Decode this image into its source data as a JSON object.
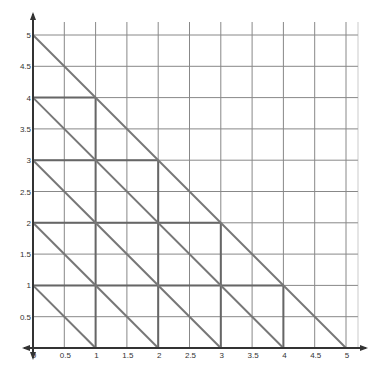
{
  "chart_data": {
    "type": "line",
    "title": "",
    "xlabel": "",
    "ylabel": "",
    "xlim": [
      0,
      5
    ],
    "ylim": [
      0,
      5
    ],
    "grid": true,
    "grid_step": 0.5,
    "x_ticks": [
      "0",
      "0.5",
      "1",
      "1.5",
      "2",
      "2.5",
      "3",
      "3.5",
      "4",
      "4.5",
      "5"
    ],
    "y_ticks": [
      "0.5",
      "1",
      "1.5",
      "2",
      "2.5",
      "3",
      "3.5",
      "4",
      "4.5",
      "5"
    ],
    "series": [
      {
        "name": "x+y=1",
        "points": [
          [
            0,
            1
          ],
          [
            1,
            0
          ]
        ]
      },
      {
        "name": "x+y=2",
        "points": [
          [
            0,
            2
          ],
          [
            2,
            0
          ]
        ]
      },
      {
        "name": "x+y=3",
        "points": [
          [
            0,
            3
          ],
          [
            3,
            0
          ]
        ]
      },
      {
        "name": "x+y=4",
        "points": [
          [
            0,
            4
          ],
          [
            4,
            0
          ]
        ]
      },
      {
        "name": "x+y=5",
        "points": [
          [
            0,
            5
          ],
          [
            5,
            0
          ]
        ]
      }
    ],
    "staircase": {
      "horizontal": [
        [
          0,
          1,
          4
        ],
        [
          0,
          2,
          3
        ],
        [
          0,
          3,
          2
        ],
        [
          0,
          4,
          1
        ]
      ],
      "vertical": [
        [
          1,
          0,
          4
        ],
        [
          2,
          0,
          3
        ],
        [
          3,
          0,
          2
        ],
        [
          4,
          0,
          1
        ]
      ]
    }
  },
  "colors": {
    "grid": "#888888",
    "axis": "#333333",
    "lines": "#777777",
    "thick": "#666666"
  }
}
